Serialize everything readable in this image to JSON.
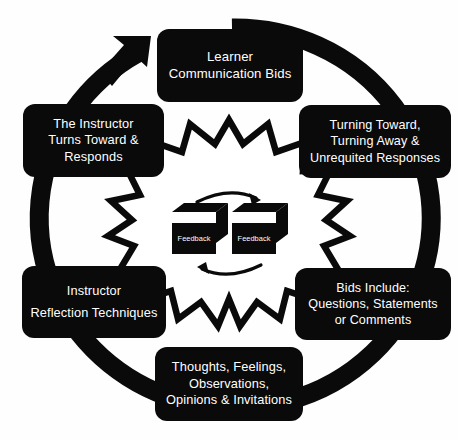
{
  "diagram": {
    "type": "cycle-diagram",
    "background_color": "#fefefe",
    "node_fill_color": "#0a0a0a",
    "node_text_color": "#ffffff",
    "outline_color": "#0a0a0a",
    "flow_direction": "clockwise",
    "outer_ring": {
      "name": "clockwise-cycle-arrow",
      "arrowhead_position": "top-left",
      "color": "#0a0a0a"
    },
    "center_burst": {
      "name": "starburst-outline",
      "fill": "#ffffff",
      "stroke": "#0a0a0a",
      "points": 16
    },
    "nodes": [
      {
        "id": "learner-communication-bids",
        "position": "top",
        "lines": [
          "Learner",
          "Communication Bids"
        ]
      },
      {
        "id": "turning-toward-away",
        "position": "right-upper",
        "lines": [
          "Turning Toward,",
          "Turning Away &",
          "Unrequited Responses"
        ]
      },
      {
        "id": "bids-include",
        "position": "right-lower",
        "lines": [
          "Bids Include:",
          "Questions, Statements",
          "or Comments"
        ]
      },
      {
        "id": "thoughts-feelings",
        "position": "bottom",
        "lines": [
          "Thoughts, Feelings,",
          "Observations,",
          "Opinions & Invitations"
        ]
      },
      {
        "id": "instructor-reflection-techniques",
        "position": "left-lower",
        "lines": [
          "Instructor",
          "Reflection Techniques"
        ]
      },
      {
        "id": "the-instructor-turns-toward",
        "position": "left-upper",
        "lines": [
          "The Instructor",
          "Turns Toward &",
          "Responds"
        ]
      }
    ],
    "center": {
      "feedback_left_label": "Feedback",
      "feedback_right_label": "Feedback",
      "arrow_top": "curved-arrow-right",
      "arrow_bottom": "curved-arrow-left"
    }
  }
}
